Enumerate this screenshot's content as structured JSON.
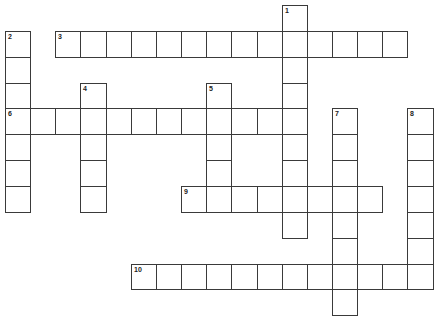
{
  "puzzle": {
    "type": "crossword",
    "grid_cols": 17,
    "grid_rows": 12,
    "entries": [
      {
        "number": "1",
        "direction": "down",
        "row": 0,
        "col": 11,
        "length": 9
      },
      {
        "number": "2",
        "direction": "down",
        "row": 1,
        "col": 0,
        "length": 7
      },
      {
        "number": "3",
        "direction": "across",
        "row": 1,
        "col": 2,
        "length": 14
      },
      {
        "number": "4",
        "direction": "down",
        "row": 3,
        "col": 3,
        "length": 5
      },
      {
        "number": "5",
        "direction": "down",
        "row": 3,
        "col": 8,
        "length": 5
      },
      {
        "number": "6",
        "direction": "across",
        "row": 4,
        "col": 0,
        "length": 12
      },
      {
        "number": "7",
        "direction": "down",
        "row": 4,
        "col": 13,
        "length": 8
      },
      {
        "number": "8",
        "direction": "down",
        "row": 4,
        "col": 16,
        "length": 7
      },
      {
        "number": "9",
        "direction": "across",
        "row": 7,
        "col": 7,
        "length": 8
      },
      {
        "number": "10",
        "direction": "across",
        "row": 10,
        "col": 5,
        "length": 12
      }
    ]
  }
}
